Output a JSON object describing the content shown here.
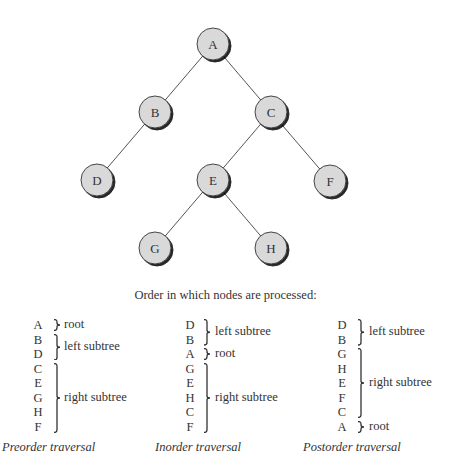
{
  "tree": {
    "nodes": [
      {
        "id": "A",
        "label": "A",
        "x": 213,
        "y": 44
      },
      {
        "id": "B",
        "label": "B",
        "x": 155,
        "y": 112
      },
      {
        "id": "C",
        "label": "C",
        "x": 271,
        "y": 112
      },
      {
        "id": "D",
        "label": "D",
        "x": 97,
        "y": 180
      },
      {
        "id": "E",
        "label": "E",
        "x": 213,
        "y": 180
      },
      {
        "id": "F",
        "label": "F",
        "x": 330,
        "y": 181
      },
      {
        "id": "G",
        "label": "G",
        "x": 155,
        "y": 248
      },
      {
        "id": "H",
        "label": "H",
        "x": 271,
        "y": 248
      }
    ],
    "edges": [
      [
        "A",
        "B"
      ],
      [
        "A",
        "C"
      ],
      [
        "B",
        "D"
      ],
      [
        "C",
        "E"
      ],
      [
        "C",
        "F"
      ],
      [
        "E",
        "G"
      ],
      [
        "E",
        "H"
      ]
    ],
    "node_fill": "#d9d9d9",
    "node_stroke": "#333333",
    "edge_color": "#555555"
  },
  "caption": "Order in which nodes are processed:",
  "traversals": [
    {
      "title": "Preorder traversal",
      "sequence": [
        "A",
        "B",
        "D",
        "C",
        "E",
        "G",
        "H",
        "F"
      ],
      "groups": [
        {
          "label": "root",
          "from": 0,
          "to": 0
        },
        {
          "label": "left subtree",
          "from": 1,
          "to": 2
        },
        {
          "label": "right subtree",
          "from": 3,
          "to": 7
        }
      ]
    },
    {
      "title": "Inorder traversal",
      "sequence": [
        "D",
        "B",
        "A",
        "G",
        "E",
        "H",
        "C",
        "F"
      ],
      "groups": [
        {
          "label": "left subtree",
          "from": 0,
          "to": 1
        },
        {
          "label": "root",
          "from": 2,
          "to": 2
        },
        {
          "label": "right subtree",
          "from": 3,
          "to": 7
        }
      ]
    },
    {
      "title": "Postorder traversal",
      "sequence": [
        "D",
        "B",
        "G",
        "H",
        "E",
        "F",
        "C",
        "A"
      ],
      "groups": [
        {
          "label": "left subtree",
          "from": 0,
          "to": 1
        },
        {
          "label": "right subtree",
          "from": 2,
          "to": 6
        },
        {
          "label": "root",
          "from": 7,
          "to": 7
        }
      ]
    }
  ]
}
